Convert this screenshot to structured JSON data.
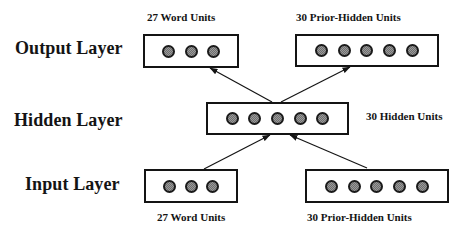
{
  "diagram": {
    "type": "recurrent neural network architecture",
    "layers": {
      "output": {
        "label": "Output Layer",
        "groups": [
          {
            "label": "27 Word Units",
            "units_drawn": 3
          },
          {
            "label": "30 Prior-Hidden Units",
            "units_drawn": 5
          }
        ]
      },
      "hidden": {
        "label": "Hidden Layer",
        "groups": [
          {
            "label": "30 Hidden Units",
            "units_drawn": 5
          }
        ]
      },
      "input": {
        "label": "Input Layer",
        "groups": [
          {
            "label": "27 Word Units",
            "units_drawn": 3
          },
          {
            "label": "30 Prior-Hidden Units",
            "units_drawn": 5
          }
        ]
      }
    },
    "connections": [
      {
        "from": "input.word_units",
        "to": "hidden.hidden_units"
      },
      {
        "from": "input.prior_hidden_units",
        "to": "hidden.hidden_units"
      },
      {
        "from": "hidden.hidden_units",
        "to": "output.word_units"
      },
      {
        "from": "hidden.hidden_units",
        "to": "output.prior_hidden_units"
      }
    ],
    "colors": {
      "stroke": "#141414",
      "unit_fill": "#9a9a9a",
      "background": "#ffffff"
    }
  }
}
